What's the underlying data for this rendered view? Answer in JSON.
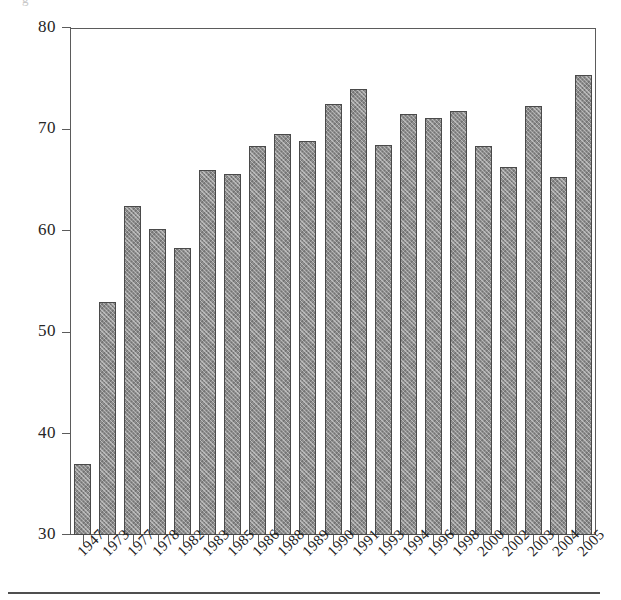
{
  "figure": {
    "title_fragment": "g",
    "footer_rule": true
  },
  "chart_data": {
    "type": "bar",
    "title": "",
    "xlabel": "",
    "ylabel": "",
    "ylim": [
      30,
      80
    ],
    "yticks": [
      30,
      40,
      50,
      60,
      70,
      80
    ],
    "grid": false,
    "legend": null,
    "categories": [
      "1947",
      "1973",
      "1977",
      "1978",
      "1982",
      "1983",
      "1985",
      "1986",
      "1988",
      "1989",
      "1990",
      "1991",
      "1993",
      "1994",
      "1996",
      "1998",
      "2000",
      "2002",
      "2003",
      "2004",
      "2005"
    ],
    "values": [
      37.0,
      53.0,
      62.4,
      60.2,
      58.3,
      66.0,
      65.6,
      68.4,
      69.5,
      68.9,
      72.5,
      74.0,
      68.5,
      71.5,
      71.1,
      71.8,
      68.4,
      66.3,
      72.3,
      65.3,
      75.4
    ],
    "bar_color": "#8d8d8d",
    "bar_edge_color": "#4a4a4a",
    "axis_color": "#5b5b5b"
  }
}
